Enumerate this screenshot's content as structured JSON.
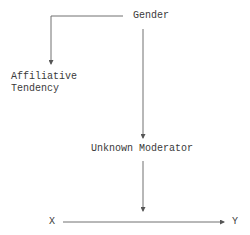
{
  "diagram": {
    "type": "path-diagram",
    "nodes": {
      "gender": {
        "label": "Gender"
      },
      "affiliative_tendency": {
        "line1": "Affiliative",
        "line2": "Tendency"
      },
      "unknown_moderator": {
        "label": "Unknown Moderator"
      },
      "x": {
        "label": "X"
      },
      "y": {
        "label": "Y"
      }
    },
    "edges": [
      {
        "from": "Gender",
        "to": "Affiliative Tendency"
      },
      {
        "from": "Gender",
        "to": "Unknown Moderator"
      },
      {
        "from": "Unknown Moderator",
        "to": "X→Y path"
      },
      {
        "from": "X",
        "to": "Y"
      }
    ],
    "colors": {
      "line": "#707070",
      "text": "#3a3a3a",
      "background": "#ffffff"
    }
  }
}
